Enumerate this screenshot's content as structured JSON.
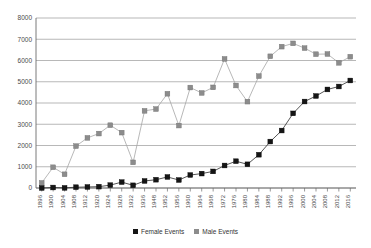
{
  "chart_data": {
    "type": "line",
    "title": "",
    "subtitle": "",
    "xlabel": "",
    "ylabel": "",
    "ylim": [
      0,
      8000
    ],
    "ytick_labels": [
      "0",
      "1000",
      "2000",
      "3000",
      "4000",
      "5000",
      "6000",
      "7000",
      "8000"
    ],
    "ytick_values": [
      0,
      1000,
      2000,
      3000,
      4000,
      5000,
      6000,
      7000,
      8000
    ],
    "grid": true,
    "legend_position": "bottom",
    "categories": [
      "1896",
      "1900",
      "1904",
      "1908",
      "1912",
      "1920",
      "1924",
      "1928",
      "1932",
      "1936",
      "1948",
      "1952",
      "1956",
      "1960",
      "1964",
      "1968",
      "1972",
      "1976",
      "1980",
      "1984",
      "1988",
      "1992",
      "1996",
      "2000",
      "2004",
      "2008",
      "2012",
      "2016"
    ],
    "series": [
      {
        "name": "Female Events",
        "color": "#151515",
        "marker": "square",
        "values": [
          0,
          23,
          6,
          37,
          48,
          63,
          135,
          277,
          126,
          331,
          390,
          519,
          376,
          611,
          678,
          781,
          1059,
          1260,
          1115,
          1566,
          2186,
          2704,
          3512,
          4069,
          4329,
          4637,
          4776,
          5059
        ]
      },
      {
        "name": "Male Events",
        "color": "#8c8c8c",
        "marker": "square",
        "values": [
          241,
          975,
          645,
          1971,
          2359,
          2561,
          2954,
          2606,
          1206,
          3632,
          3714,
          4436,
          2938,
          4727,
          4473,
          4735,
          6075,
          4824,
          4064,
          5263,
          6197,
          6652,
          6806,
          6582,
          6296,
          6305,
          5892,
          6179
        ]
      }
    ]
  },
  "legend": {
    "items": [
      {
        "label": "Female Events",
        "color": "#151515"
      },
      {
        "label": "Male Events",
        "color": "#8c8c8c"
      }
    ]
  }
}
